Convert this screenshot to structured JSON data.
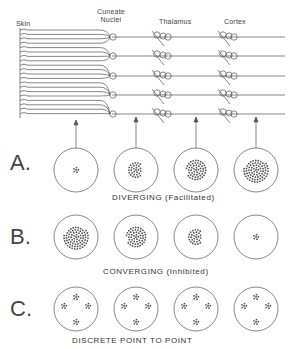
{
  "regions": {
    "skin": "Skin",
    "cuneate_line1": "Cuneate",
    "cuneate_line2": "Nuclei",
    "thalamus": "Thalamus",
    "cortex": "Cortex"
  },
  "rows": [
    {
      "letter": "A.",
      "caption": "DIVERGING  (Facilitated)",
      "densities": [
        6,
        30,
        55,
        75
      ]
    },
    {
      "letter": "B.",
      "caption": "CONVERGING  (Inhibited)",
      "densities": [
        75,
        55,
        30,
        6
      ]
    },
    {
      "letter": "C.",
      "caption": "DISCRETE  POINT  TO  POINT",
      "densities": [
        "4 clusters",
        "4 clusters",
        "4 clusters",
        "4 clusters"
      ]
    }
  ],
  "colors": {
    "ink": "#444444",
    "background": "#ffffff"
  }
}
